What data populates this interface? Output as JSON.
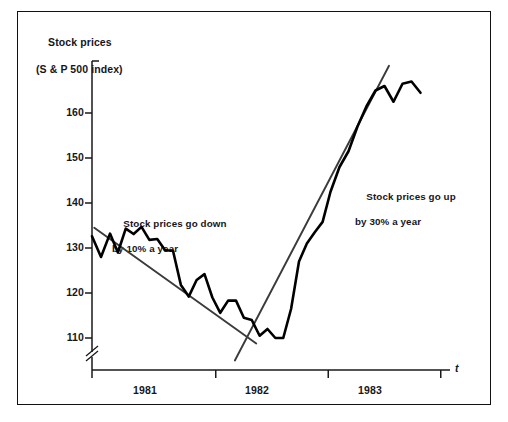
{
  "figure": {
    "background_color": "#ffffff",
    "frame_color": "#111111",
    "series_color": "#000000",
    "trend_color": "#3a3a3a"
  },
  "chart_data": {
    "type": "line",
    "title": "Stock prices",
    "subtitle": "(S & P 500 index)",
    "xlabel": "t",
    "ylabel": "Stock prices (S & P 500 index)",
    "grid": false,
    "legend": "none",
    "axis_break": true,
    "ylim": [
      105,
      172
    ],
    "yticks": [
      110,
      120,
      130,
      140,
      150,
      160
    ],
    "ytick_labels": [
      "110",
      "120",
      "130",
      "140",
      "150",
      "160"
    ],
    "xlim": [
      1980.75,
      1984.0
    ],
    "xticks": [
      1980.9,
      1982.0,
      1983.0,
      1984.0
    ],
    "xtick_labels": [
      "1981",
      "1982",
      "1983"
    ],
    "series": [
      {
        "name": "S & P 500 index",
        "style": "zigzag",
        "x": [
          1980.9,
          1980.98,
          1981.06,
          1981.13,
          1981.2,
          1981.27,
          1981.34,
          1981.41,
          1981.48,
          1981.55,
          1981.62,
          1981.69,
          1981.76,
          1981.83,
          1981.9,
          1981.97,
          1982.04,
          1982.11,
          1982.18,
          1982.25,
          1982.32,
          1982.39,
          1982.46,
          1982.53,
          1982.6,
          1982.67,
          1982.74,
          1982.81,
          1982.88,
          1982.95,
          1983.02,
          1983.1,
          1983.18,
          1983.26,
          1983.34,
          1983.42,
          1983.5,
          1983.58,
          1983.66,
          1983.74,
          1983.82
        ],
        "y": [
          132.6,
          128.0,
          133.2,
          129.0,
          134.3,
          133.1,
          134.7,
          131.8,
          132.0,
          129.5,
          129.4,
          121.8,
          119.2,
          122.9,
          124.2,
          119.0,
          115.6,
          118.3,
          118.3,
          114.5,
          114.0,
          110.5,
          112.0,
          110.0,
          110.0,
          116.5,
          127.0,
          131.0,
          133.5,
          135.8,
          142.5,
          148.0,
          151.5,
          157.0,
          161.5,
          165.0,
          166.0,
          162.5,
          166.5,
          167.0,
          164.5
        ]
      }
    ],
    "trendlines": [
      {
        "name": "down-trend",
        "label": "Stock prices go down by 10% a year",
        "label_line1": "Stock prices go down",
        "label_line2": "by 10% a year",
        "x_start": 1980.92,
        "y_start": 134.5,
        "x_end": 1982.36,
        "y_end": 108.8
      },
      {
        "name": "up-trend",
        "label": "Stock prices go up by 30% a year",
        "label_line1": "Stock prices go up",
        "label_line2": "by 30% a year",
        "x_start": 1982.17,
        "y_start": 105.0,
        "x_end": 1983.54,
        "y_end": 170.5
      }
    ]
  },
  "annotations": [
    {
      "name": "down-annotation",
      "line1": "Stock prices go down",
      "line2": "by 10% a year",
      "left_px": 112,
      "top_px": 205
    },
    {
      "name": "up-annotation",
      "line1": "Stock prices go up",
      "line2": "by 30% a year",
      "left_px": 355,
      "top_px": 178
    }
  ],
  "axis": {
    "y_title_line1": "Stock prices",
    "y_title_line2": "(S & P 500 index)",
    "x_axis_symbol": "t"
  }
}
